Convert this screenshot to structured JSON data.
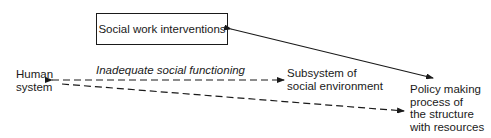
{
  "diagram": {
    "nodes": {
      "interventions": "Social work interventions",
      "human_system": [
        "Human",
        "system"
      ],
      "subsystem": [
        "Subsystem of",
        "social environment"
      ],
      "policy": [
        "Policy making",
        "process of",
        "the structure",
        "with resources"
      ]
    },
    "edges": {
      "inadequate_label": "Inadequate social functioning"
    },
    "colors": {
      "line": "#1a1a1a",
      "background": "#ffffff"
    }
  }
}
